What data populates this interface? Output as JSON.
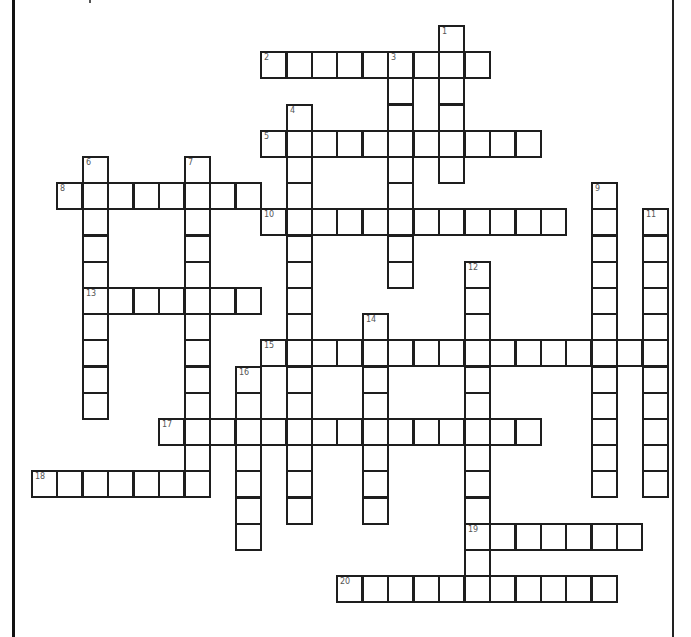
{
  "puzzle": {
    "type": "crossword",
    "grid_origin": {
      "x": 31,
      "y": 25
    },
    "cell_pitch": {
      "x": 25.45,
      "y": 26.2
    },
    "cell_size": {
      "w": 27,
      "h": 28
    },
    "colors": {
      "line": "#1e1e1e",
      "number": "#555555",
      "background": "#ffffff"
    },
    "words": [
      {
        "number": "1",
        "direction": "down",
        "col": 16,
        "row": 0,
        "length": 6
      },
      {
        "number": "2",
        "direction": "across",
        "col": 9,
        "row": 1,
        "length": 9
      },
      {
        "number": "3",
        "direction": "down",
        "col": 14,
        "row": 1,
        "length": 9
      },
      {
        "number": "4",
        "direction": "down",
        "col": 10,
        "row": 3,
        "length": 16
      },
      {
        "number": "5",
        "direction": "across",
        "col": 9,
        "row": 4,
        "length": 11
      },
      {
        "number": "6",
        "direction": "down",
        "col": 2,
        "row": 5,
        "length": 10
      },
      {
        "number": "7",
        "direction": "down",
        "col": 6,
        "row": 5,
        "length": 13
      },
      {
        "number": "8",
        "direction": "across",
        "col": 1,
        "row": 6,
        "length": 8
      },
      {
        "number": "9",
        "direction": "down",
        "col": 22,
        "row": 6,
        "length": 12
      },
      {
        "number": "10",
        "direction": "across",
        "col": 9,
        "row": 7,
        "length": 12
      },
      {
        "number": "11",
        "direction": "down",
        "col": 24,
        "row": 7,
        "length": 11
      },
      {
        "number": "12",
        "direction": "down",
        "col": 17,
        "row": 9,
        "length": 13
      },
      {
        "number": "13",
        "direction": "across",
        "col": 2,
        "row": 10,
        "length": 7
      },
      {
        "number": "14",
        "direction": "down",
        "col": 13,
        "row": 11,
        "length": 8
      },
      {
        "number": "15",
        "direction": "across",
        "col": 9,
        "row": 12,
        "length": 16
      },
      {
        "number": "16",
        "direction": "down",
        "col": 8,
        "row": 13,
        "length": 7
      },
      {
        "number": "17",
        "direction": "across",
        "col": 5,
        "row": 15,
        "length": 15
      },
      {
        "number": "18",
        "direction": "across",
        "col": 0,
        "row": 17,
        "length": 7
      },
      {
        "number": "19",
        "direction": "across",
        "col": 17,
        "row": 19,
        "length": 7
      },
      {
        "number": "20",
        "direction": "across",
        "col": 12,
        "row": 21,
        "length": 11
      }
    ]
  }
}
